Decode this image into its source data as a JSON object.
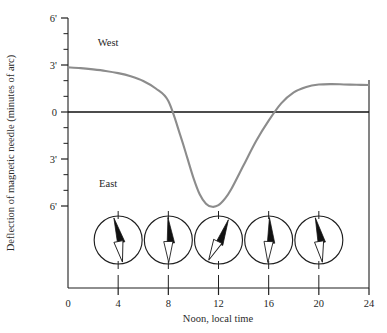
{
  "chart_data": {
    "type": "line",
    "title": "",
    "subtitle": "",
    "xlabel": "Noon, local time",
    "ylabel": "Deflection of magnetic needle (minutes of arc)",
    "xlim": [
      0,
      24
    ],
    "ylim": [
      -6,
      6
    ],
    "grid": false,
    "legend": null,
    "x_ticks": [
      0,
      4,
      8,
      12,
      16,
      20,
      24
    ],
    "x_tick_labels": [
      "0",
      "4",
      "8",
      "12",
      "16",
      "20",
      "24"
    ],
    "x_minor_step": 1,
    "y_ticks": [
      6,
      3,
      0,
      -3,
      -6
    ],
    "y_tick_labels": [
      "6'",
      "3'",
      "0",
      "3'",
      "6'"
    ],
    "y_minor_step": 1,
    "annotations": [
      {
        "text": "West",
        "x": 3.2,
        "y": 4.5,
        "name": "west-label"
      },
      {
        "text": "East",
        "x": 3.2,
        "y": -4.5,
        "name": "east-label"
      }
    ],
    "series": [
      {
        "name": "Magnetic declination diurnal variation",
        "color": "#8c8c8c",
        "width": 2.1,
        "x": [
          0,
          1,
          2,
          3,
          4,
          5,
          6,
          7,
          8,
          9,
          9.5,
          10,
          10.5,
          11,
          11.5,
          12,
          12.5,
          13,
          14,
          15,
          16,
          17,
          18,
          19,
          20,
          21,
          22,
          23,
          24
        ],
        "y": [
          2.85,
          2.8,
          2.72,
          2.62,
          2.48,
          2.28,
          1.98,
          1.5,
          0.7,
          -1.6,
          -2.9,
          -4.2,
          -5.25,
          -5.85,
          -6.05,
          -5.95,
          -5.55,
          -4.95,
          -3.4,
          -1.85,
          -0.55,
          0.55,
          1.25,
          1.6,
          1.75,
          1.78,
          1.76,
          1.74,
          1.72
        ]
      }
    ],
    "zero_line": {
      "y": 0,
      "color": "#111111",
      "width": 1.4
    },
    "compasses": [
      {
        "name": "compass-rose-4h",
        "x": 4,
        "needle_deg": -11
      },
      {
        "name": "compass-rose-8h",
        "x": 8,
        "needle_deg": -1
      },
      {
        "name": "compass-rose-12h",
        "x": 12,
        "needle_deg": 26
      },
      {
        "name": "compass-rose-16h",
        "x": 16,
        "needle_deg": 2
      },
      {
        "name": "compass-rose-20h",
        "x": 20,
        "needle_deg": -9
      }
    ]
  }
}
